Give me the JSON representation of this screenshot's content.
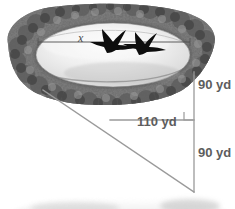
{
  "figure": {
    "labels": {
      "unknown_side": "x",
      "right_vertical_top": "90 yd",
      "horizontal_middle": "110 yd",
      "right_vertical_bottom": "90 yd"
    },
    "icons": {
      "bird_left": "bird-silhouette-icon",
      "bird_right": "bird-silhouette-icon",
      "right_angle": "right-angle-marker-icon"
    },
    "colors": {
      "text": "#5d5d5d",
      "line": "#8a8a8a",
      "water_light": "#f2f2f2",
      "water_dark": "#c9c9c9",
      "trees": "#6f6f6f",
      "bird": "#101010",
      "background": "#ffffff"
    }
  },
  "geometry": {
    "lake_center_x": 113,
    "lake_center_y": 55,
    "lake_rx": 78,
    "lake_ry": 33,
    "x_line": {
      "x1": 38,
      "y1": 42,
      "x2": 190,
      "y2": 42
    },
    "vertical_line": {
      "x": 194,
      "y1": 72,
      "y2": 192
    },
    "horizontal_line": {
      "y": 120,
      "x1": 110,
      "x2": 194
    },
    "hypotenuse": {
      "x1": 43,
      "y1": 90,
      "x2": 194,
      "y2": 192
    },
    "right_angle_marker": {
      "x": 183,
      "y": 111,
      "size": 9
    }
  }
}
